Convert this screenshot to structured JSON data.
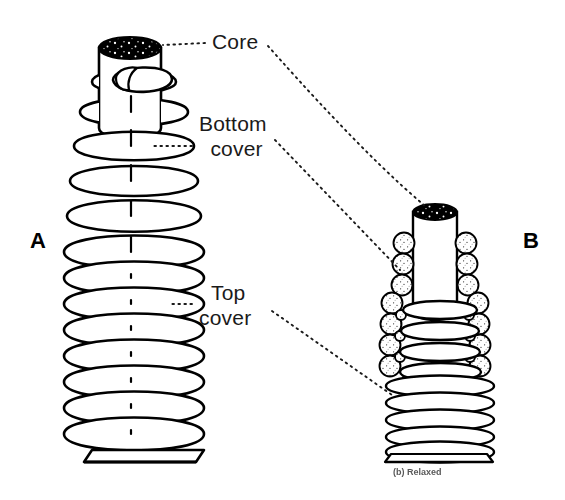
{
  "figure": {
    "background_color": "#ffffff",
    "line_color": "#000000",
    "leader_style": "dotted",
    "panels": [
      {
        "letter": "A",
        "name": "extended-spring",
        "state": "extended",
        "core_top_fill": "#000000",
        "coil_turns_upper": 6,
        "coil_turns_lower": 9
      },
      {
        "letter": "B",
        "name": "relaxed-spring",
        "state": "relaxed",
        "caption": "(b) Relaxed",
        "core_top_fill": "#000000",
        "bead_count_per_side": 7,
        "coil_turns_upper": 5,
        "coil_turns_lower": 7
      }
    ],
    "labels": [
      {
        "id": "core",
        "text": "Core",
        "lines": [
          "Core"
        ]
      },
      {
        "id": "bottom",
        "text": "Bottom cover",
        "lines": [
          "Bottom",
          "cover"
        ]
      },
      {
        "id": "top",
        "text": "Top cover",
        "lines": [
          "Top",
          "cover"
        ]
      }
    ]
  },
  "labels": {
    "core": "Core",
    "bottom_line1": "Bottom",
    "bottom_line2": "cover",
    "top_line1": "Top",
    "top_line2": "cover"
  },
  "panel_letters": {
    "a": "A",
    "b": "B"
  },
  "captions": {
    "panel_b": "(b) Relaxed"
  }
}
